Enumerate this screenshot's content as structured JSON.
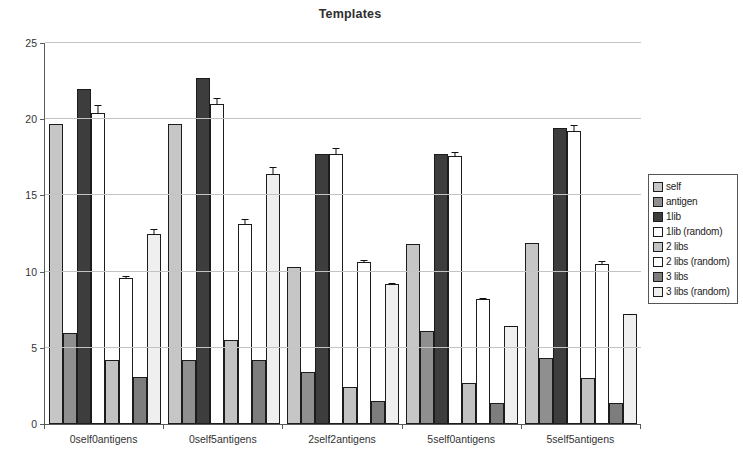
{
  "chart_data": {
    "type": "bar",
    "title": "Templates",
    "categories": [
      "0self0antigens",
      "0self5antigens",
      "2self2antigens",
      "5self0antigens",
      "5self5antigens"
    ],
    "series": [
      {
        "name": "self",
        "color": "#c6c6c6",
        "textured": true,
        "values": [
          19.7,
          19.7,
          10.3,
          11.8,
          11.9
        ]
      },
      {
        "name": "antigen",
        "color": "#8f8f8f",
        "textured": true,
        "values": [
          6.0,
          4.2,
          3.4,
          6.1,
          4.3
        ]
      },
      {
        "name": "1lib",
        "color": "#3d3d3d",
        "textured": true,
        "values": [
          22.0,
          22.7,
          17.7,
          17.7,
          19.4
        ]
      },
      {
        "name": "1lib (random)",
        "color": "#ffffff",
        "textured": false,
        "values": [
          20.4,
          21.0,
          17.7,
          17.6,
          19.2
        ],
        "errors": [
          0.6,
          0.45,
          0.5,
          0.3,
          0.5
        ]
      },
      {
        "name": "2 libs",
        "color": "#c2c2c2",
        "textured": true,
        "values": [
          4.2,
          5.5,
          2.4,
          2.7,
          3.0
        ]
      },
      {
        "name": "2 libs (random)",
        "color": "#ffffff",
        "textured": false,
        "values": [
          9.6,
          13.1,
          10.6,
          8.2,
          10.5
        ],
        "errors": [
          0.2,
          0.4,
          0.2,
          0.15,
          0.25
        ]
      },
      {
        "name": "3 libs",
        "color": "#7d7d7d",
        "textured": true,
        "values": [
          3.1,
          4.2,
          1.5,
          1.4,
          1.4
        ]
      },
      {
        "name": "3 libs (random)",
        "color": "#efefef",
        "textured": true,
        "values": [
          12.5,
          16.4,
          9.2,
          6.4,
          7.2
        ],
        "errors": [
          0.35,
          0.55,
          0.15,
          0.1,
          0.1
        ]
      }
    ],
    "ylim": [
      0,
      25
    ],
    "yticks": [
      0,
      5,
      10,
      15,
      20,
      25
    ],
    "grid": "horizontal",
    "legend_position": "right",
    "error_bars_on": [
      "1lib (random)",
      "2 libs (random)",
      "3 libs (random)"
    ]
  }
}
